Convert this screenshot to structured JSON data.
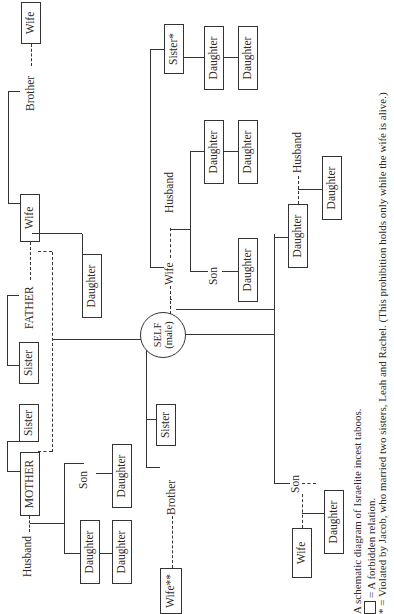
{
  "diagram": {
    "title": "Israelite incest taboos",
    "orientation": "rotated 90 degrees counterclockwise",
    "nodes": {
      "father_wife_brother_wife": "Wife",
      "father_brother": "Brother",
      "father_wife": "Wife",
      "father": "FATHER",
      "father_daughter": "Daughter",
      "father_sister": "Sister",
      "mother_sister": "Sister",
      "mother": "MOTHER",
      "mother_husband": "Husband",
      "self_line1": "SELF",
      "self_line2": "(male)",
      "self_sister": "Sister",
      "self_brother": "Brother",
      "brother_wife": "Wife**",
      "mother_daughter": "Daughter",
      "mother_daughter_daughter": "Daughter",
      "mother_son": "Son",
      "mother_son_daughter": "Daughter",
      "wife": "Wife",
      "wife_sister": "Sister*",
      "wife_sister_daughter_1": "Daughter",
      "wife_sister_daughter_2": "Daughter",
      "wife_husband": "Husband",
      "wife_daughter": "Daughter",
      "wife_daughter_daughter": "Daughter",
      "wife_son": "Son",
      "wife_son_daughter": "Daughter",
      "self_daughter": "Daughter",
      "daughter_husband": "Husband",
      "daughter_daughter": "Daughter",
      "self_son": "Son",
      "son_wife": "Wife",
      "son_daughter": "Daughter"
    }
  },
  "caption": {
    "line1": "A schematic diagram of Israelite incest taboos.",
    "line2": "= A forbidden relation.",
    "line3": "* = Violated by Jacob, who married two sisters, Leah and Rachel. (This prohibition holds only while the wife is alive.)"
  }
}
